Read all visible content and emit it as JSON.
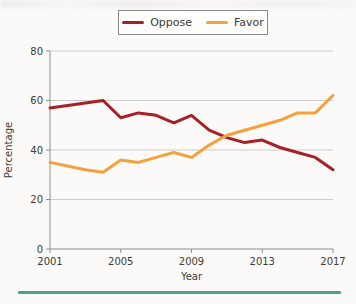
{
  "page": {
    "divider_color": "#4aa38f"
  },
  "legend": {
    "items": [
      {
        "label": "Oppose",
        "color": "#a52127"
      },
      {
        "label": "Favor",
        "color": "#f5a03d"
      }
    ]
  },
  "chart_data": {
    "type": "line",
    "title": "",
    "xlabel": "Year",
    "ylabel": "Percentage",
    "x": [
      2001,
      2003,
      2004,
      2005,
      2006,
      2007,
      2008,
      2009,
      2010,
      2011,
      2012,
      2013,
      2014,
      2015,
      2016,
      2017
    ],
    "series": [
      {
        "name": "Oppose",
        "color": "#a52127",
        "values": [
          57,
          59,
          60,
          53,
          55,
          54,
          51,
          54,
          48,
          45,
          43,
          44,
          41,
          39,
          37,
          32
        ]
      },
      {
        "name": "Favor",
        "color": "#f5a03d",
        "values": [
          35,
          32,
          31,
          36,
          35,
          37,
          39,
          37,
          42,
          46,
          48,
          50,
          52,
          55,
          55,
          62
        ]
      }
    ],
    "xlim": [
      2001,
      2017
    ],
    "ylim": [
      0,
      80
    ],
    "xticks": [
      2001,
      2005,
      2009,
      2013,
      2017
    ],
    "yticks": [
      0,
      20,
      40,
      60,
      80
    ],
    "grid": true,
    "legend_position": "top-center",
    "colors": {
      "gridline": "#cdcdcd",
      "axis": "#8f8f8f",
      "tick_text": "#3c3c3c"
    }
  }
}
